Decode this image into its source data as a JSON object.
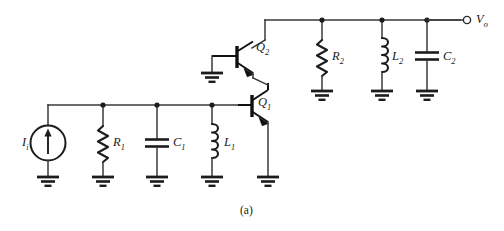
{
  "figure": {
    "caption": "(a)",
    "background_color": "#ffffff",
    "line_color": "#1c1c1c",
    "width": 504,
    "height": 231
  },
  "labels": {
    "input_source": {
      "symbol": "I",
      "subscript": "i",
      "name": "input-current-source"
    },
    "r1": {
      "symbol": "R",
      "subscript": "1"
    },
    "c1": {
      "symbol": "C",
      "subscript": "1"
    },
    "l1": {
      "symbol": "L",
      "subscript": "1"
    },
    "q1": {
      "symbol": "Q",
      "subscript": "1"
    },
    "q2": {
      "symbol": "Q",
      "subscript": "2"
    },
    "r2": {
      "symbol": "R",
      "subscript": "2"
    },
    "l2": {
      "symbol": "L",
      "subscript": "2"
    },
    "c2": {
      "symbol": "C",
      "subscript": "2"
    },
    "output": {
      "symbol": "V",
      "subscript": "o"
    }
  },
  "components": [
    {
      "id": "Ii",
      "type": "current-source",
      "label": "I_i",
      "net_top": "input-node",
      "net_bottom": "ground"
    },
    {
      "id": "R1",
      "type": "resistor",
      "label": "R_1",
      "net_top": "input-node",
      "net_bottom": "ground"
    },
    {
      "id": "C1",
      "type": "capacitor",
      "label": "C_1",
      "net_top": "input-node",
      "net_bottom": "ground"
    },
    {
      "id": "L1",
      "type": "inductor",
      "label": "L_1",
      "net_top": "input-node",
      "net_bottom": "ground"
    },
    {
      "id": "Q1",
      "type": "npn-transistor",
      "label": "Q_1",
      "base": "input-node",
      "collector": "cascode-node",
      "emitter": "ground"
    },
    {
      "id": "Q2",
      "type": "npn-transistor",
      "label": "Q_2",
      "base": "ground",
      "collector": "output-node",
      "emitter": "cascode-node"
    },
    {
      "id": "R2",
      "type": "resistor",
      "label": "R_2",
      "net_top": "output-node",
      "net_bottom": "ground"
    },
    {
      "id": "L2",
      "type": "inductor",
      "label": "L_2",
      "net_top": "output-node",
      "net_bottom": "ground"
    },
    {
      "id": "C2",
      "type": "capacitor",
      "label": "C_2",
      "net_top": "output-node",
      "net_bottom": "ground"
    },
    {
      "id": "Vo",
      "type": "output-terminal",
      "label": "V_o",
      "net": "output-node"
    }
  ],
  "icons": {
    "ground": "ground-icon",
    "terminal": "open-terminal-icon",
    "junction": "junction-dot-icon"
  }
}
